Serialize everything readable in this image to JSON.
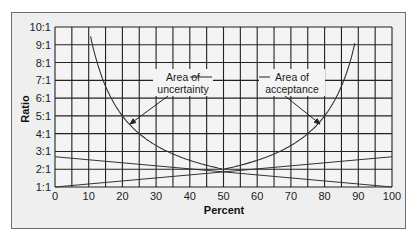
{
  "chart_data": {
    "type": "line",
    "title": "",
    "xlabel": "Percent",
    "ylabel": "Ratio",
    "xlim": [
      0,
      100
    ],
    "ylim": [
      1,
      10
    ],
    "grid": true,
    "x_ticks": [
      "0",
      "10",
      "20",
      "30",
      "40",
      "50",
      "60",
      "70",
      "80",
      "90",
      "100"
    ],
    "y_ticks": [
      "1:1",
      "2:1",
      "3:1",
      "4:1",
      "5:1",
      "6:1",
      "7:1",
      "8:1",
      "9:1",
      "10:1"
    ],
    "series": [
      {
        "name": "Ratio curve (left branch)",
        "x": [
          10.5,
          12,
          15,
          20,
          25,
          30,
          35,
          40,
          45,
          50
        ],
        "y": [
          9.5,
          8.3,
          6.7,
          5.0,
          4.0,
          3.3,
          2.9,
          2.5,
          2.2,
          2.0
        ]
      },
      {
        "name": "Ratio curve (right branch)",
        "x": [
          50,
          55,
          60,
          65,
          70,
          75,
          80,
          85,
          88,
          89.5
        ],
        "y": [
          2.0,
          2.2,
          2.5,
          2.9,
          3.3,
          4.0,
          5.0,
          6.7,
          8.3,
          9.5
        ]
      },
      {
        "name": "Rising straight line",
        "x": [
          0,
          100
        ],
        "y": [
          1.0,
          2.7
        ]
      },
      {
        "name": "Falling straight line",
        "x": [
          0,
          100
        ],
        "y": [
          2.7,
          1.0
        ]
      }
    ],
    "annotations": [
      {
        "text": "Area of uncertainty",
        "x": 37,
        "y": 8.2,
        "arrow_to": [
          21,
          4.3
        ]
      },
      {
        "text": "Area of acceptance",
        "x": 64,
        "y": 8.2,
        "arrow_to": [
          79,
          4.3
        ]
      }
    ],
    "legend": null
  },
  "labels": {
    "xlabel": "Percent",
    "ylabel": "Ratio",
    "anno_left_line1": "Area of",
    "anno_left_line2": "uncertainty",
    "anno_right_line1": "Area of",
    "anno_right_line2": "acceptance"
  }
}
